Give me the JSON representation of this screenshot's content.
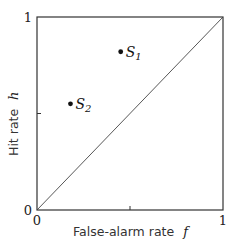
{
  "chart_data": {
    "type": "scatter",
    "title": "",
    "xlabel": "False-alarm rate",
    "xlabel_var": "f",
    "ylabel": "Hit rate",
    "ylabel_var": "h",
    "xlim": [
      0,
      1
    ],
    "ylim": [
      0,
      1
    ],
    "grid": false,
    "x_ticks": [
      0,
      0.5,
      1
    ],
    "y_ticks": [
      0,
      0.5,
      1
    ],
    "x_tick_labels": [
      "0",
      "",
      "1"
    ],
    "y_tick_labels": [
      "0",
      "",
      "1"
    ],
    "reference_line": {
      "from": [
        0,
        0
      ],
      "to": [
        1,
        1
      ],
      "label": "chance diagonal"
    },
    "points": [
      {
        "name": "S",
        "subscript": "1",
        "x": 0.45,
        "y": 0.82
      },
      {
        "name": "S",
        "subscript": "2",
        "x": 0.18,
        "y": 0.55
      }
    ]
  }
}
